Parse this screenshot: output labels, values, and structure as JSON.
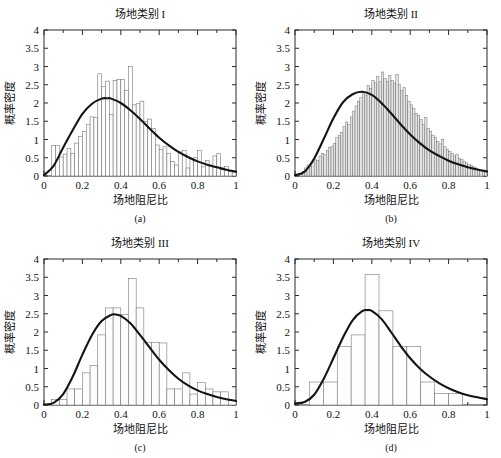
{
  "figure": {
    "background": "#ffffff",
    "axis_color": "#2b2b2b",
    "curve_color": "#141414",
    "bar_fill_sparse": "#fdfdfd",
    "bar_fill_dense": "#e2e2e2",
    "bottom_note": ""
  },
  "common": {
    "xlabel": "场地阻尼比",
    "ylabel": "概率密度",
    "xticks": [
      "0",
      "0.2",
      "0.4",
      "0.6",
      "0.8",
      "1"
    ],
    "xtick_values": [
      0,
      0.2,
      0.4,
      0.6,
      0.8,
      1
    ],
    "yticks": [
      "0",
      "0.5",
      "1",
      "1.5",
      "2",
      "2.5",
      "3",
      "3.5",
      "4"
    ],
    "ytick_values": [
      0,
      0.5,
      1,
      1.5,
      2,
      2.5,
      3,
      3.5,
      4
    ],
    "xlim": [
      0,
      1
    ],
    "ylim": [
      0,
      4
    ]
  },
  "panels": [
    {
      "key": "a",
      "title": "场地类别 I",
      "caption": "(a)"
    },
    {
      "key": "b",
      "title": "场地类别 II",
      "caption": "(b)"
    },
    {
      "key": "c",
      "title": "场地类别 III",
      "caption": "(c)"
    },
    {
      "key": "d",
      "title": "场地类别 IV",
      "caption": "(d)"
    }
  ],
  "chart_data": [
    {
      "id": "a",
      "type": "bar",
      "title": "场地类别 I",
      "caption": "(a)",
      "xlabel": "场地阻尼比",
      "ylabel": "概率密度",
      "xlim": [
        0,
        1
      ],
      "ylim": [
        0,
        4
      ],
      "grid": false,
      "legend": "none",
      "bin_width": 0.02,
      "bin_start": 0.0,
      "bar_style": "sparse",
      "values": [
        0.0,
        0.0,
        0.83,
        0.83,
        0.52,
        0.6,
        0.75,
        0.62,
        0.9,
        1.08,
        1.22,
        1.42,
        1.62,
        1.6,
        2.8,
        2.45,
        2.6,
        1.68,
        2.62,
        2.65,
        2.65,
        2.35,
        3.0,
        1.95,
        1.98,
        2.05,
        1.5,
        1.56,
        1.3,
        0.85,
        0.72,
        0.8,
        0.62,
        0.4,
        0.3,
        0.66,
        0.7,
        0.22,
        0.48,
        0.5,
        0.7,
        0.25,
        0.42,
        0.3,
        0.55,
        0.62,
        0.22,
        0.26,
        0.12,
        0.1
      ],
      "series": [
        {
          "name": "拟合概率密度曲线",
          "type": "line",
          "distribution": "lognormal-like",
          "peak_x": 0.33,
          "peak_y": 2.13,
          "x": [
            0.0,
            0.05,
            0.1,
            0.15,
            0.2,
            0.25,
            0.3,
            0.33,
            0.35,
            0.4,
            0.45,
            0.5,
            0.55,
            0.6,
            0.65,
            0.7,
            0.75,
            0.8,
            0.85,
            0.9,
            0.95,
            1.0
          ],
          "y": [
            0.02,
            0.28,
            0.78,
            1.26,
            1.7,
            1.98,
            2.12,
            2.13,
            2.12,
            2.0,
            1.8,
            1.56,
            1.3,
            1.05,
            0.84,
            0.66,
            0.52,
            0.4,
            0.31,
            0.24,
            0.17,
            0.12
          ]
        }
      ]
    },
    {
      "id": "b",
      "type": "bar",
      "title": "场地类别 II",
      "caption": "(b)",
      "xlabel": "场地阻尼比",
      "ylabel": "概率密度",
      "xlim": [
        0,
        1
      ],
      "ylim": [
        0,
        4
      ],
      "grid": false,
      "legend": "none",
      "bin_width": 0.0125,
      "bin_start": 0.0,
      "bar_style": "dense",
      "values": [
        0.0,
        0.0,
        0.05,
        0.12,
        0.22,
        0.3,
        0.26,
        0.38,
        0.45,
        0.42,
        0.55,
        0.62,
        0.58,
        0.7,
        0.78,
        0.82,
        0.9,
        1.05,
        1.12,
        1.2,
        1.35,
        1.48,
        1.42,
        1.62,
        1.78,
        1.92,
        2.05,
        2.15,
        2.28,
        2.22,
        2.48,
        2.4,
        2.62,
        2.55,
        2.72,
        2.58,
        2.85,
        2.68,
        2.6,
        2.75,
        2.62,
        2.55,
        2.78,
        2.5,
        2.35,
        2.42,
        2.2,
        2.05,
        1.95,
        1.85,
        1.72,
        1.66,
        1.55,
        1.42,
        1.6,
        1.3,
        1.22,
        1.12,
        1.05,
        0.95,
        0.88,
        1.0,
        0.8,
        0.72,
        0.68,
        0.62,
        0.55,
        0.6,
        0.48,
        0.45,
        0.4,
        0.36,
        0.32,
        0.28,
        0.25,
        0.22,
        0.18,
        0.15,
        0.12,
        0.1
      ],
      "series": [
        {
          "name": "拟合概率密度曲线",
          "type": "line",
          "distribution": "lognormal-like",
          "peak_x": 0.35,
          "peak_y": 2.31,
          "x": [
            0.0,
            0.05,
            0.1,
            0.15,
            0.2,
            0.25,
            0.3,
            0.35,
            0.4,
            0.45,
            0.5,
            0.55,
            0.6,
            0.65,
            0.7,
            0.75,
            0.8,
            0.85,
            0.9,
            0.95,
            1.0
          ],
          "y": [
            0.02,
            0.12,
            0.48,
            1.02,
            1.58,
            2.02,
            2.24,
            2.31,
            2.22,
            2.0,
            1.72,
            1.42,
            1.14,
            0.9,
            0.7,
            0.55,
            0.42,
            0.32,
            0.24,
            0.18,
            0.13
          ]
        }
      ]
    },
    {
      "id": "c",
      "type": "bar",
      "title": "场地类别 III",
      "caption": "(c)",
      "xlabel": "场地阻尼比",
      "ylabel": "概率密度",
      "xlim": [
        0,
        1
      ],
      "ylim": [
        0,
        4
      ],
      "grid": false,
      "legend": "none",
      "bin_width": 0.04,
      "bin_start": 0.0,
      "bar_style": "sparse",
      "values": [
        0.0,
        0.15,
        0.15,
        0.44,
        0.44,
        0.88,
        1.08,
        1.92,
        2.66,
        2.66,
        2.48,
        3.46,
        2.66,
        1.72,
        1.72,
        1.7,
        0.44,
        0.44,
        0.88,
        0.3,
        0.62,
        0.44,
        0.36,
        0.36,
        0.12
      ],
      "series": [
        {
          "name": "拟合概率密度曲线",
          "type": "line",
          "distribution": "lognormal-like",
          "peak_x": 0.37,
          "peak_y": 2.48,
          "x": [
            0.0,
            0.05,
            0.1,
            0.15,
            0.2,
            0.25,
            0.3,
            0.35,
            0.37,
            0.4,
            0.45,
            0.5,
            0.55,
            0.6,
            0.65,
            0.7,
            0.75,
            0.8,
            0.85,
            0.9,
            0.95,
            1.0
          ],
          "y": [
            0.01,
            0.06,
            0.3,
            0.78,
            1.38,
            1.92,
            2.3,
            2.47,
            2.48,
            2.44,
            2.24,
            1.92,
            1.58,
            1.24,
            0.96,
            0.72,
            0.54,
            0.4,
            0.3,
            0.22,
            0.16,
            0.11
          ]
        }
      ]
    },
    {
      "id": "d",
      "type": "bar",
      "title": "场地类别 IV",
      "caption": "(d)",
      "xlabel": "场地阻尼比",
      "ylabel": "概率密度",
      "xlim": [
        0,
        1
      ],
      "ylim": [
        0,
        4
      ],
      "grid": false,
      "legend": "none",
      "bin_width": 0.0725,
      "bin_start": 0.075,
      "bar_style": "sparse",
      "values": [
        0.63,
        0.63,
        1.6,
        1.92,
        3.57,
        2.58,
        1.6,
        1.6,
        0.63,
        0.32,
        0.32
      ],
      "series": [
        {
          "name": "拟合概率密度曲线",
          "type": "line",
          "distribution": "lognormal-like",
          "peak_x": 0.38,
          "peak_y": 2.6,
          "x": [
            0.0,
            0.05,
            0.1,
            0.15,
            0.2,
            0.25,
            0.3,
            0.35,
            0.38,
            0.4,
            0.45,
            0.5,
            0.55,
            0.6,
            0.65,
            0.7,
            0.75,
            0.8,
            0.85,
            0.9,
            0.95,
            1.0
          ],
          "y": [
            0.04,
            0.08,
            0.28,
            0.72,
            1.28,
            1.85,
            2.32,
            2.57,
            2.6,
            2.58,
            2.36,
            2.0,
            1.62,
            1.28,
            1.0,
            0.78,
            0.6,
            0.46,
            0.35,
            0.27,
            0.21,
            0.16
          ]
        }
      ]
    }
  ]
}
